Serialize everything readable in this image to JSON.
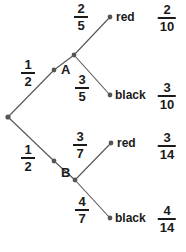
{
  "diagram": {
    "type": "probability-tree",
    "colors": {
      "line": "#555555",
      "node": "#555555",
      "text": "#1a1a1a",
      "background": "#ffffff"
    },
    "root": {
      "name": "root-node",
      "x": 8,
      "y": 117
    },
    "stage1": [
      {
        "name": "node-a",
        "label": "A",
        "probability": {
          "numerator": "1",
          "denominator": "2"
        },
        "x": 54,
        "y": 70,
        "label_x": 61,
        "label_y": 63,
        "frac_x": 28,
        "frac_y": 58
      },
      {
        "name": "node-b",
        "label": "B",
        "probability": {
          "numerator": "1",
          "denominator": "2"
        },
        "x": 54,
        "y": 161,
        "label_x": 61,
        "label_y": 166,
        "frac_x": 28,
        "frac_y": 143
      }
    ],
    "stage2": [
      {
        "name": "leaf-a-red",
        "parent": "A",
        "outcome": "red",
        "probability": {
          "numerator": "2",
          "denominator": "5"
        },
        "joint": {
          "numerator": "2",
          "denominator": "10"
        },
        "vertex_x": 74,
        "vertex_y": 55,
        "x": 110,
        "y": 17,
        "label_x": 116,
        "label_y": 11,
        "frac_x": 81,
        "frac_y": 2,
        "joint_x": 167,
        "joint_y": 3
      },
      {
        "name": "leaf-a-black",
        "parent": "A",
        "outcome": "black",
        "probability": {
          "numerator": "3",
          "denominator": "5"
        },
        "joint": {
          "numerator": "3",
          "denominator": "10"
        },
        "vertex_x": 74,
        "vertex_y": 55,
        "x": 110,
        "y": 95,
        "label_x": 115,
        "label_y": 89,
        "frac_x": 82,
        "frac_y": 73,
        "joint_x": 167,
        "joint_y": 81
      },
      {
        "name": "leaf-b-red",
        "parent": "B",
        "outcome": "red",
        "probability": {
          "numerator": "3",
          "denominator": "7"
        },
        "joint": {
          "numerator": "3",
          "denominator": "14"
        },
        "vertex_x": 75,
        "vertex_y": 180,
        "x": 111,
        "y": 143,
        "label_x": 117,
        "label_y": 137,
        "frac_x": 80,
        "frac_y": 130,
        "joint_x": 167,
        "joint_y": 131
      },
      {
        "name": "leaf-b-black",
        "parent": "B",
        "outcome": "black",
        "probability": {
          "numerator": "4",
          "denominator": "7"
        },
        "joint": {
          "numerator": "4",
          "denominator": "14"
        },
        "vertex_x": 75,
        "vertex_y": 180,
        "x": 110,
        "y": 218,
        "label_x": 115,
        "label_y": 212,
        "frac_x": 82,
        "frac_y": 195,
        "joint_x": 167,
        "joint_y": 204
      }
    ]
  }
}
